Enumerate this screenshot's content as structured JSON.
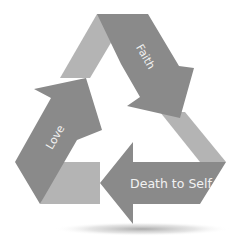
{
  "diagram": {
    "type": "cycle",
    "shape": "triangular-recycle-arrows",
    "colors": {
      "background": "#ffffff",
      "arrow_dark": "#8a8a8a",
      "band_light": "#b4b4b4",
      "label_text": "#f2f2f2",
      "shadow": "#9a9a9a"
    },
    "steps": [
      {
        "id": "faith",
        "label": "Faith",
        "direction": "down-right"
      },
      {
        "id": "death-to-self",
        "label": "Death to Self",
        "direction": "left"
      },
      {
        "id": "love",
        "label": "Love",
        "direction": "up-right"
      }
    ],
    "flow": [
      "Faith",
      "Death to Self",
      "Love"
    ]
  }
}
